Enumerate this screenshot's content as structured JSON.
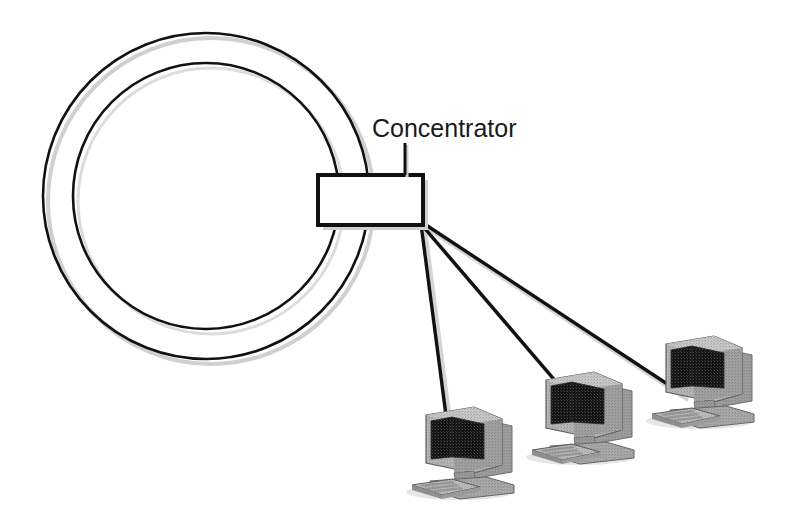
{
  "diagram": {
    "background_color": "#ffffff",
    "stroke_color": "#111111",
    "shadow_color": "#cccccc",
    "labels": {
      "concentrator": "Concentrator"
    },
    "ring": {
      "name": "token-ring",
      "center_x": 206,
      "center_y": 196,
      "outer_radius": 163,
      "inner_radius": 133,
      "stroke_width": 2.6
    },
    "concentrator_box": {
      "x": 318,
      "y": 175,
      "width": 105,
      "height": 50,
      "fill": "#ffffff",
      "stroke_width": 4
    },
    "leader_line": {
      "x": 405,
      "y1": 143,
      "y2": 175
    },
    "label_position": {
      "x": 372,
      "y": 137
    },
    "links": [
      {
        "name": "link-to-workstation-1",
        "x1": 421,
        "y1": 224,
        "x2": 447,
        "y2": 423
      },
      {
        "name": "link-to-workstation-2",
        "x1": 421,
        "y1": 224,
        "x2": 570,
        "y2": 398
      },
      {
        "name": "link-to-workstation-3",
        "x1": 423,
        "y1": 223,
        "x2": 684,
        "y2": 395
      }
    ],
    "workstations": [
      {
        "name": "workstation-1",
        "x": 408,
        "y": 393,
        "scale": 1.0,
        "label": ""
      },
      {
        "name": "workstation-2",
        "x": 528,
        "y": 358,
        "scale": 1.0,
        "label": ""
      },
      {
        "name": "workstation-3",
        "x": 648,
        "y": 322,
        "scale": 1.0,
        "label": ""
      }
    ],
    "colors": {
      "screen": "#141414",
      "case_light": "#b8b8b8",
      "case_mid": "#9d9d9d",
      "case_dark": "#848484",
      "case_shadow": "#6e6e6e",
      "outline": "#5a5a5a"
    }
  }
}
